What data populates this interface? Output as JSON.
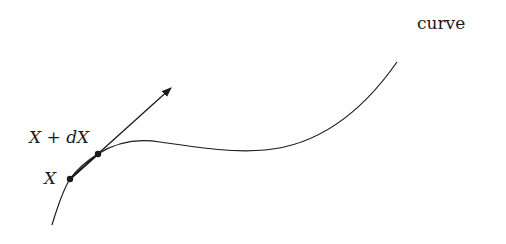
{
  "diagram": {
    "curve_label": "curve",
    "point_x_label": "X",
    "point_xdx_label": "X + dX",
    "stroke_color": "#1a1a1a",
    "background": "#ffffff"
  }
}
